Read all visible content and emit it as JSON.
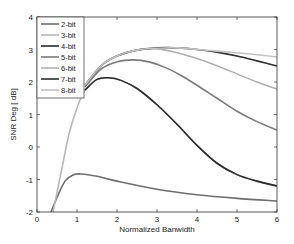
{
  "chart_data": {
    "type": "line",
    "title": "",
    "xlabel": "Normalized Banwidth",
    "ylabel": "SNR Deg [ dB]",
    "xlim": [
      0,
      6
    ],
    "ylim": [
      -2,
      4
    ],
    "xticks": [
      0,
      1,
      2,
      3,
      4,
      5,
      6
    ],
    "yticks": [
      -2,
      -1,
      0,
      1,
      2,
      3,
      4
    ],
    "grid": false,
    "legend_position": "upper left",
    "series": [
      {
        "name": "2-bit",
        "color": "#6e6e6e",
        "x": [
          0.35,
          0.5,
          0.7,
          0.9,
          1.1,
          1.5,
          2,
          3,
          4,
          5,
          6
        ],
        "values": [
          -2.0,
          -1.55,
          -1.05,
          -0.86,
          -0.83,
          -0.9,
          -1.05,
          -1.3,
          -1.47,
          -1.58,
          -1.66
        ]
      },
      {
        "name": "3-bit",
        "color": "#b8b8b8",
        "x": [
          0.4,
          0.6,
          0.8,
          1.0,
          1.2,
          1.5,
          1.8,
          2.1,
          2.5,
          3,
          3.5,
          4,
          4.5,
          5,
          5.5,
          6
        ],
        "values": [
          -2.0,
          -0.8,
          0.4,
          1.2,
          1.75,
          2.08,
          2.13,
          2.05,
          1.8,
          1.3,
          0.7,
          0.05,
          -0.5,
          -0.85,
          -1.05,
          -1.2
        ]
      },
      {
        "name": "4-bit",
        "color": "#2a2a2a",
        "x": [
          1.2,
          1.5,
          1.8,
          2.1,
          2.5,
          3,
          3.5,
          4,
          4.5,
          5,
          5.5,
          6
        ],
        "values": [
          1.75,
          2.08,
          2.13,
          2.05,
          1.8,
          1.3,
          0.7,
          0.05,
          -0.5,
          -0.85,
          -1.05,
          -1.2
        ]
      },
      {
        "name": "5-bit",
        "color": "#7a7a7a",
        "x": [
          1.2,
          1.6,
          2.0,
          2.4,
          2.8,
          3.2,
          3.6,
          4,
          4.5,
          5,
          5.5,
          6
        ],
        "values": [
          1.85,
          2.4,
          2.62,
          2.68,
          2.62,
          2.45,
          2.2,
          1.9,
          1.5,
          1.1,
          0.78,
          0.52
        ]
      },
      {
        "name": "6-bit",
        "color": "#b0b0b0",
        "x": [
          1.2,
          1.6,
          2.0,
          2.5,
          3.0,
          3.5,
          4,
          4.5,
          5,
          5.5,
          6
        ],
        "values": [
          1.9,
          2.5,
          2.8,
          2.98,
          3.02,
          2.9,
          2.72,
          2.5,
          2.25,
          2.0,
          1.78
        ]
      },
      {
        "name": "7-bit",
        "color": "#2e2e2e",
        "x": [
          1.2,
          1.6,
          2.0,
          2.5,
          3.0,
          3.5,
          4,
          4.5,
          5,
          5.5,
          6
        ],
        "values": [
          1.9,
          2.5,
          2.8,
          2.98,
          3.05,
          3.05,
          3.0,
          2.92,
          2.8,
          2.65,
          2.49
        ]
      },
      {
        "name": "8-bit",
        "color": "#c4c4c4",
        "x": [
          1.2,
          1.6,
          2.0,
          2.5,
          3.0,
          3.5,
          4,
          4.5,
          5,
          5.5,
          6
        ],
        "values": [
          1.9,
          2.5,
          2.8,
          2.98,
          3.04,
          3.05,
          3.0,
          2.95,
          2.9,
          2.84,
          2.77
        ]
      }
    ]
  }
}
